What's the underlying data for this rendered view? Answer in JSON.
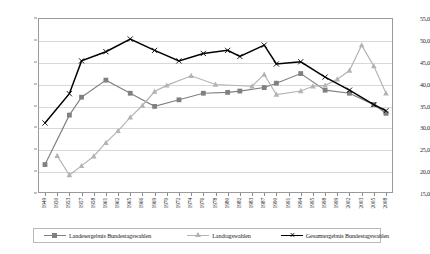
{
  "chart_data": {
    "type": "line",
    "title": "",
    "subtitle": "",
    "xlabel": "",
    "ylabel": "",
    "ylim": [
      15.0,
      55.0
    ],
    "ytick_step": 5.0,
    "ytick_labels": [
      "55,0",
      "50,0",
      "45,0",
      "40,0",
      "35,0",
      "30,0",
      "25,0",
      "20,0",
      "15,0"
    ],
    "ytick_values": [
      55.0,
      50.0,
      45.0,
      40.0,
      35.0,
      30.0,
      25.0,
      20.0,
      15.0
    ],
    "grid": true,
    "grid_orientation": "horizontal",
    "legend_position": "bottom",
    "decimal_separator": ",",
    "categories": [
      "1949",
      "1950",
      "1953",
      "1957",
      "1958",
      "1961",
      "1962",
      "1965",
      "1966",
      "1969",
      "1970",
      "1972",
      "1974",
      "1976",
      "1978",
      "1980",
      "1982",
      "1983",
      "1987",
      "1990",
      "1991",
      "1994",
      "1995",
      "1998",
      "1999",
      "2002",
      "2003",
      "2005",
      "2008"
    ],
    "series": [
      {
        "name": "Landesergebnis Bundestagswahlen",
        "color": "#808080",
        "marker": "square",
        "values": [
          21.5,
          null,
          32.8,
          36.9,
          null,
          40.8,
          null,
          37.8,
          null,
          34.8,
          null,
          36.3,
          null,
          37.8,
          null,
          38.0,
          38.3,
          null,
          39.1,
          40.1,
          null,
          42.3,
          null,
          38.5,
          null,
          37.8,
          null,
          35.2,
          33.2
        ]
      },
      {
        "name": "Landtagswahlen",
        "color": "#b3b3b3",
        "marker": "triangle",
        "values": [
          null,
          23.5,
          19.1,
          21.2,
          23.4,
          26.5,
          29.2,
          32.3,
          35.0,
          38.2,
          39.6,
          null,
          41.8,
          null,
          39.8,
          null,
          null,
          39.4,
          42.1,
          37.5,
          null,
          38.3,
          39.4,
          39.6,
          41.0,
          43.0,
          48.8,
          44.0,
          37.8
        ]
      },
      {
        "name": "Gesamtergebnis Bundestagswahlen",
        "color": "#000000",
        "marker": "x",
        "values": [
          31.0,
          null,
          37.7,
          45.2,
          null,
          47.3,
          null,
          50.2,
          null,
          47.6,
          null,
          45.2,
          null,
          46.9,
          null,
          47.6,
          46.2,
          null,
          48.8,
          44.5,
          null,
          45.0,
          null,
          41.5,
          null,
          38.5,
          null,
          35.2,
          33.8
        ]
      }
    ]
  },
  "legend": {
    "entries": [
      {
        "label": "Landesergebnis Bundestagswahlen"
      },
      {
        "label": "Landtagswahlen"
      },
      {
        "label": "Gesamtergebnis Bundestagswahlen"
      }
    ]
  },
  "colors": {
    "series_landesergebnis": "#808080",
    "series_landtagswahlen": "#b3b3b3",
    "series_gesamtergebnis": "#000000",
    "grid": "#d8d8d8",
    "frame": "#9a9a9a",
    "background": "#ffffff"
  }
}
